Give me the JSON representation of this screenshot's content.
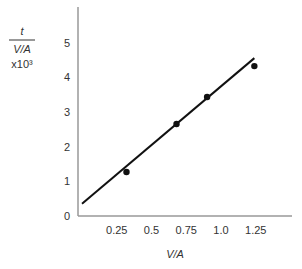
{
  "chart_data": {
    "type": "scatter",
    "title": "",
    "xlabel": "V/A",
    "ylabel": {
      "numerator": "t",
      "denominator": "V/A",
      "multiplier": "x10³"
    },
    "xlim": [
      0,
      1.45
    ],
    "ylim": [
      0,
      6
    ],
    "x_ticks": [
      "0.25",
      "0.5",
      "0.75",
      "1.0",
      "1.25"
    ],
    "x_tick_values": [
      0.25,
      0.5,
      0.75,
      1.0,
      1.25
    ],
    "y_ticks": [
      "0",
      "1",
      "2",
      "3",
      "4",
      "5"
    ],
    "y_tick_values": [
      0,
      1,
      2,
      3,
      4,
      5
    ],
    "grid": false,
    "legend": null,
    "series": [
      {
        "name": "measured",
        "kind": "points",
        "x": [
          0.32,
          0.68,
          0.9,
          1.24
        ],
        "y": [
          1.27,
          2.65,
          3.43,
          4.32
        ]
      },
      {
        "name": "fit line",
        "kind": "line",
        "x": [
          0.0,
          1.24
        ],
        "y": [
          0.35,
          4.55
        ]
      }
    ],
    "colors": {
      "axis": "#999999",
      "line": "#111111",
      "points": "#111111",
      "text": "#333333"
    }
  }
}
